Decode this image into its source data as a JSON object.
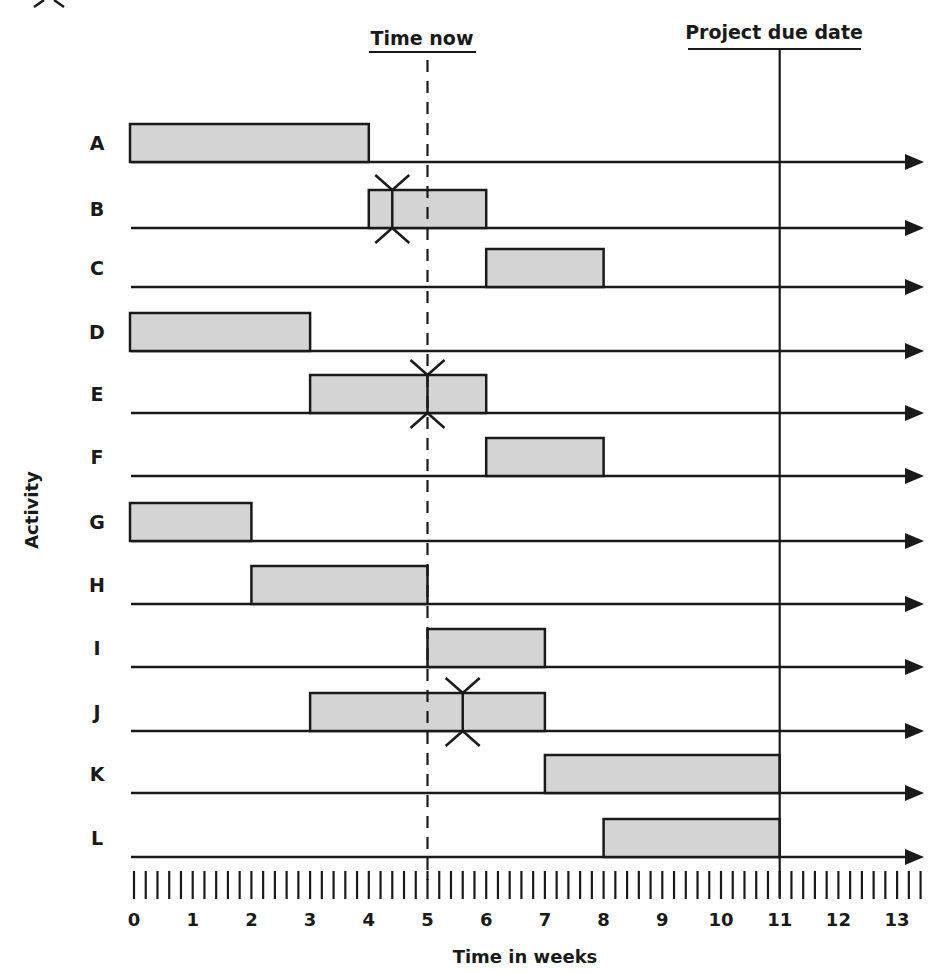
{
  "chart_data": {
    "type": "gantt",
    "title": "",
    "xlabel": "Time in weeks",
    "ylabel": "Activity",
    "x_ticks": [
      0,
      1,
      2,
      3,
      4,
      5,
      6,
      7,
      8,
      9,
      10,
      11,
      12,
      13
    ],
    "minor_ticks_per_week": 5,
    "xlim": [
      0,
      13.6
    ],
    "time_now": {
      "label": "Time now",
      "week": 5
    },
    "due_date": {
      "label": "Project due date",
      "week": 11
    },
    "activities": [
      {
        "name": "A",
        "start": 0,
        "end": 4,
        "marker": null
      },
      {
        "name": "B",
        "start": 4,
        "end": 6,
        "marker": 4.4
      },
      {
        "name": "C",
        "start": 6,
        "end": 8,
        "marker": null
      },
      {
        "name": "D",
        "start": 0,
        "end": 3,
        "marker": null
      },
      {
        "name": "E",
        "start": 3,
        "end": 6,
        "marker": 5
      },
      {
        "name": "F",
        "start": 6,
        "end": 8,
        "marker": null
      },
      {
        "name": "G",
        "start": 0,
        "end": 2,
        "marker": null
      },
      {
        "name": "H",
        "start": 2,
        "end": 5,
        "marker": null
      },
      {
        "name": "I",
        "start": 5,
        "end": 7,
        "marker": null
      },
      {
        "name": "J",
        "start": 3,
        "end": 7,
        "marker": 5.6
      },
      {
        "name": "K",
        "start": 7,
        "end": 11,
        "marker": null
      },
      {
        "name": "L",
        "start": 8,
        "end": 11,
        "marker": null
      }
    ]
  },
  "labels": {
    "time_now": "Time now",
    "due_date": "Project due date",
    "x_axis": "Time in weeks",
    "y_axis": "Activity"
  },
  "colors": {
    "bar_fill": "#d4d4d4",
    "ink": "#1a1a1a"
  }
}
